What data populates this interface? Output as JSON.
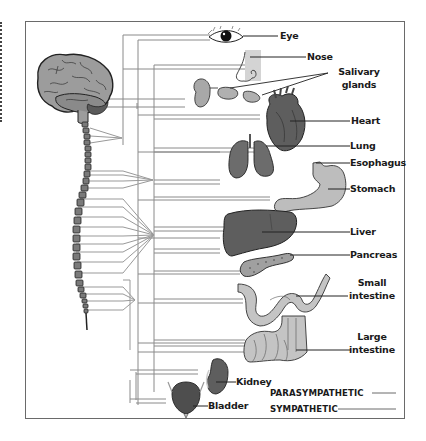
{
  "diagram": {
    "organs": [
      {
        "id": "eye",
        "label": "Eye"
      },
      {
        "id": "nose",
        "label": "Nose"
      },
      {
        "id": "salivary",
        "label_line1": "Salivary",
        "label_line2": "glands"
      },
      {
        "id": "heart",
        "label": "Heart"
      },
      {
        "id": "lung",
        "label": "Lung"
      },
      {
        "id": "esophagus",
        "label": "Esophagus"
      },
      {
        "id": "stomach",
        "label": "Stomach"
      },
      {
        "id": "liver",
        "label": "Liver"
      },
      {
        "id": "pancreas",
        "label": "Pancreas"
      },
      {
        "id": "small_intestine",
        "label_line1": "Small",
        "label_line2": "intestine"
      },
      {
        "id": "large_intestine",
        "label_line1": "Large",
        "label_line2": "intestine"
      },
      {
        "id": "kidney",
        "label": "Kidney"
      },
      {
        "id": "bladder",
        "label": "Bladder"
      }
    ],
    "legend": {
      "parasympathetic": "PARASYMPATHETIC",
      "sympathetic": "SYMPATHETIC"
    },
    "colors": {
      "frame": "#6a6a6a",
      "nerve_line": "#8a8a8a",
      "organ_dark": "#5e5e5e",
      "organ_light": "#b8b8b8",
      "brain": "#9a9a9a"
    }
  }
}
